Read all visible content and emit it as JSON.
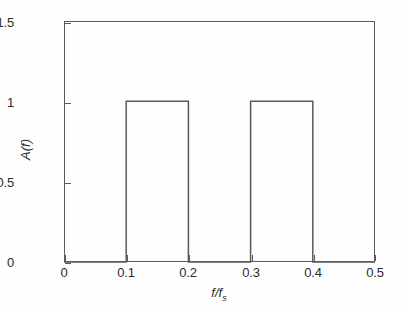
{
  "chart_data": {
    "type": "line",
    "title": "",
    "subtitle": "",
    "xlabel": "f/f_s",
    "xlabel_main": "f/f",
    "xlabel_sub": "s",
    "ylabel": "A(f)",
    "xlim": [
      0,
      0.5
    ],
    "ylim": [
      0,
      1.5
    ],
    "grid": false,
    "legend": "none",
    "xticks": [
      0,
      0.1,
      0.2,
      0.3,
      0.4,
      0.5
    ],
    "xticklabels": [
      "0",
      "0.1",
      "0.2",
      "0.3",
      "0.4",
      "0.5"
    ],
    "yticks": [
      0,
      0.5,
      1,
      1.5
    ],
    "yticklabels": [
      "0",
      "0.5",
      "1",
      "1.5"
    ],
    "series": [
      {
        "name": "A(f)",
        "description": "Ideal dual passband amplitude response: two unity-gain rectangular bands",
        "color": "#5a5a5a",
        "x": [
          0,
          0.1,
          0.1,
          0.2,
          0.2,
          0.3,
          0.3,
          0.4,
          0.4,
          0.5
        ],
        "y": [
          0,
          0,
          1,
          1,
          0,
          0,
          1,
          1,
          0,
          0
        ]
      }
    ],
    "passbands": [
      {
        "start": 0.1,
        "end": 0.2,
        "amplitude": 1
      },
      {
        "start": 0.3,
        "end": 0.4,
        "amplitude": 1
      }
    ],
    "stopbands": [
      {
        "start": 0.0,
        "end": 0.1,
        "amplitude": 0
      },
      {
        "start": 0.2,
        "end": 0.3,
        "amplitude": 0
      },
      {
        "start": 0.4,
        "end": 0.5,
        "amplitude": 0
      }
    ],
    "colors": {
      "trace": "#5a5a5a",
      "axis": "#5a5a5a",
      "text": "#2b2b2b",
      "background": "#ffffff"
    }
  }
}
